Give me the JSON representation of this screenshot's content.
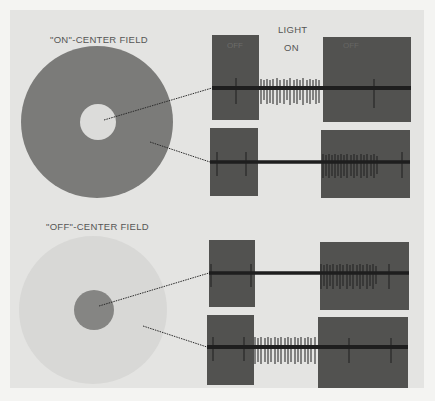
{
  "title_on_center": "\"ON\"-CENTER FIELD",
  "title_off_center": "\"OFF\"-CENTER FIELD",
  "stimulus_label_line1": "LIGHT",
  "stimulus_label_line2": "ON",
  "period_labels": {
    "before": "OFF",
    "after": "OFF"
  },
  "colors": {
    "background": "#f4f4f2",
    "panel": "#e4e4e2",
    "dark_field": "#7b7b79",
    "light_field": "#d8d8d6",
    "off_box": "#525250",
    "trace": "#1e1e1e"
  },
  "receptive_fields": [
    {
      "name": "on-center",
      "surround": "dark",
      "center": "light"
    },
    {
      "name": "off-center",
      "surround": "light",
      "center": "dark"
    }
  ],
  "recordings": [
    {
      "field": "on-center",
      "stimulated_region": "center",
      "light_off_spikes": "sparse",
      "light_on_spikes": "dense",
      "after_off_spikes": "sparse"
    },
    {
      "field": "on-center",
      "stimulated_region": "surround",
      "light_off_spikes": "sparse",
      "light_on_spikes": "none",
      "after_off_spikes": "dense"
    },
    {
      "field": "off-center",
      "stimulated_region": "center",
      "light_off_spikes": "sparse",
      "light_on_spikes": "none",
      "after_off_spikes": "dense"
    },
    {
      "field": "off-center",
      "stimulated_region": "surround",
      "light_off_spikes": "sparse",
      "light_on_spikes": "dense",
      "after_off_spikes": "sparse"
    }
  ]
}
